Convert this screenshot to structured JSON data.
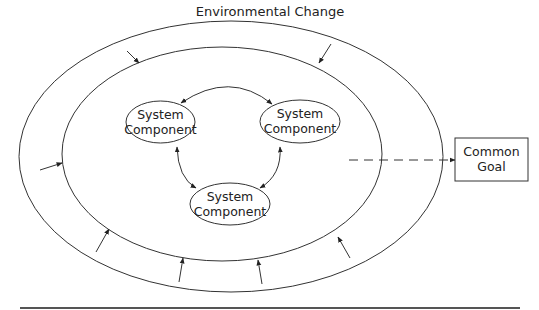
{
  "diagram": {
    "environment_label": "Environmental Change",
    "components": [
      {
        "line1": "System",
        "line2": "Component"
      },
      {
        "line1": "System",
        "line2": "Component"
      },
      {
        "line1": "System",
        "line2": "Component"
      }
    ],
    "goal": {
      "line1": "Common",
      "line2": "Goal"
    },
    "colors": {
      "stroke": "#333333",
      "text": "#222222",
      "background": "#ffffff"
    }
  }
}
